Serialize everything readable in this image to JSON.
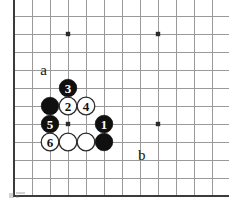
{
  "figure": {
    "type": "go-board-diagram",
    "board": {
      "cols": 12,
      "rows": 10,
      "cell_size": 18,
      "origin_x": 14,
      "origin_y": 16,
      "left_edge": true,
      "bottom_edge": true,
      "top_edge": false,
      "right_edge": false,
      "line_color": "#9a9a9a",
      "edge_color": "#3b3b3b",
      "background": "#ffffff"
    },
    "star_points": [
      {
        "name": "star-point-upper-left",
        "col": 3,
        "row": 1
      },
      {
        "name": "star-point-upper-right",
        "col": 8,
        "row": 1
      },
      {
        "name": "star-point-lower-left",
        "col": 3,
        "row": 6
      },
      {
        "name": "star-point-lower-right",
        "col": 8,
        "row": 6
      }
    ],
    "stones": [
      {
        "id": "stone-black-plain-upper",
        "color": "black",
        "label": "",
        "col": 2,
        "row": 5
      },
      {
        "id": "stone-black-3",
        "color": "black",
        "label": "3",
        "col": 3,
        "row": 4
      },
      {
        "id": "stone-white-2",
        "color": "white",
        "label": "2",
        "col": 3,
        "row": 5
      },
      {
        "id": "stone-white-4",
        "color": "white",
        "label": "4",
        "col": 4,
        "row": 5
      },
      {
        "id": "stone-black-5",
        "color": "black",
        "label": "5",
        "col": 2,
        "row": 6
      },
      {
        "id": "stone-black-1",
        "color": "black",
        "label": "1",
        "col": 5,
        "row": 6
      },
      {
        "id": "stone-white-6",
        "color": "white",
        "label": "6",
        "col": 2,
        "row": 7
      },
      {
        "id": "stone-white-plain-a",
        "color": "white",
        "label": "",
        "col": 3,
        "row": 7
      },
      {
        "id": "stone-white-plain-b",
        "color": "white",
        "label": "",
        "col": 4,
        "row": 7
      },
      {
        "id": "stone-black-plain-lower",
        "color": "black",
        "label": "",
        "col": 5,
        "row": 7
      }
    ],
    "coordinate_labels": [
      {
        "id": "label-a",
        "text": "a",
        "col": 1.65,
        "row": 3.0
      },
      {
        "id": "label-b",
        "text": "b",
        "col": 7.1,
        "row": 7.7
      }
    ],
    "colors": {
      "black_stone": "#101010",
      "white_stone": "#ffffff",
      "stone_outline": "#2a2a2a",
      "grid": "#9a9a9a",
      "edge": "#3b3b3b",
      "text": "#1a1a1a"
    }
  }
}
